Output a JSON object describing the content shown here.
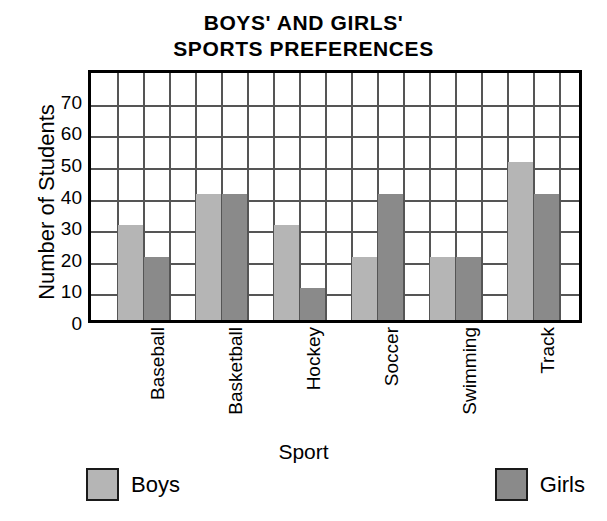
{
  "chart_data": {
    "type": "bar",
    "title": "BOYS' AND GIRLS' SPORTS PREFERENCES",
    "title_lines": [
      "BOYS' AND GIRLS'",
      "SPORTS PREFERENCES"
    ],
    "xlabel": "Sport",
    "ylabel": "Number of Students",
    "categories": [
      "Baseball",
      "Basketball",
      "Hockey",
      "Soccer",
      "Swimming",
      "Track"
    ],
    "series": [
      {
        "name": "Boys",
        "color": "#b5b5b5",
        "values": [
          30,
          40,
          30,
          20,
          20,
          50
        ]
      },
      {
        "name": "Girls",
        "color": "#8a8a8a",
        "values": [
          20,
          40,
          10,
          40,
          20,
          40
        ]
      }
    ],
    "ylim": [
      0,
      80
    ],
    "yticks": [
      0,
      10,
      20,
      30,
      40,
      50,
      60,
      70
    ],
    "ytick_labels": [
      "0",
      "10",
      "20",
      "30",
      "40",
      "50",
      "60",
      "70"
    ],
    "grid": true,
    "grid_columns": 19,
    "legend_position": "bottom",
    "axis_color": "#000000",
    "grid_color": "#555555"
  }
}
